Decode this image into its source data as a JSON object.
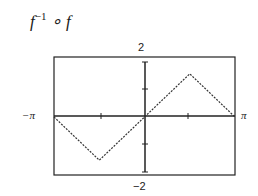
{
  "title": {
    "base": "f",
    "sup": "−1",
    "rest": " ∘ f"
  },
  "axes": {
    "ymax_label": "2",
    "ymin_label": "−2",
    "xmin_label": "−π",
    "xmax_label": "π"
  },
  "chart_data": {
    "type": "line",
    "xlabel": "",
    "ylabel": "",
    "xlim": [
      -3.1416,
      3.1416
    ],
    "ylim": [
      -2,
      2
    ],
    "xticks": [
      "−π",
      "π"
    ],
    "yticks": [
      "−2",
      "2"
    ],
    "grid": false,
    "series": [
      {
        "name": "f^-1(f(x))",
        "style": "dotted",
        "x": [
          -3.1416,
          -1.5708,
          0,
          1.5708,
          3.1416
        ],
        "y": [
          0,
          -1.5708,
          0,
          1.5708,
          0
        ]
      }
    ]
  }
}
